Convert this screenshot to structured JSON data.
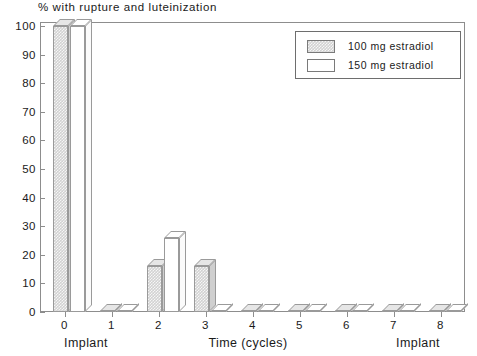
{
  "chart_data": {
    "type": "bar",
    "title": "% with rupture and luteinization",
    "xlabel": "Time (cycles)",
    "ylabel": "",
    "xlim": [
      -0.5,
      8.5
    ],
    "ylim": [
      0,
      100
    ],
    "grid": false,
    "legend_position": "top-right",
    "categories": [
      "0",
      "1",
      "2",
      "3",
      "4",
      "5",
      "6",
      "7",
      "8"
    ],
    "xtick_labels": [
      "0",
      "1",
      "2",
      "3",
      "4",
      "5",
      "6",
      "7",
      "8"
    ],
    "ytick_labels": [
      "0",
      "10",
      "20",
      "30",
      "40",
      "50",
      "60",
      "70",
      "80",
      "90",
      "100"
    ],
    "ytick_values": [
      0,
      10,
      20,
      30,
      40,
      50,
      60,
      70,
      80,
      90,
      100
    ],
    "annotations": [
      {
        "text": "Implant",
        "x": 0
      },
      {
        "text": "Implant",
        "x": 7.6
      }
    ],
    "series": [
      {
        "name": "100 mg estradiol",
        "fill": "hatched-gray",
        "color": "#d2d2d2",
        "values": [
          100,
          0,
          16,
          16,
          0,
          0,
          0,
          0,
          0
        ]
      },
      {
        "name": "150 mg estradiol",
        "fill": "open-white",
        "color": "#ffffff",
        "values": [
          100,
          0,
          26,
          0,
          0,
          0,
          0,
          0,
          0
        ]
      }
    ]
  },
  "legend": {
    "entries": [
      {
        "label": "100 mg estradiol"
      },
      {
        "label": "150 mg estradiol"
      }
    ]
  },
  "axis": {
    "x_caption": "Time (cycles)",
    "implant_left": "Implant",
    "implant_right": "Implant"
  }
}
